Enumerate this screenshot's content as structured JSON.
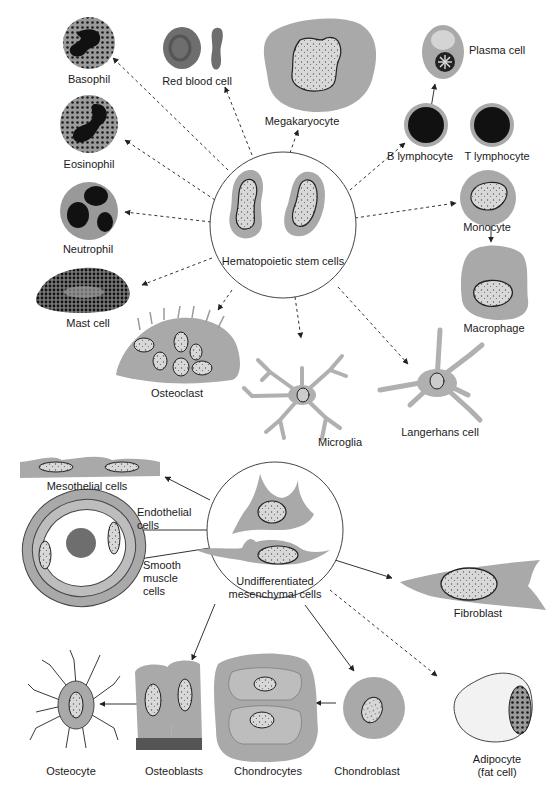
{
  "diagram": {
    "type": "cell lineage diagram",
    "colors": {
      "cytoplasm": "#a9a9a9",
      "cytoplasm_light": "#bdbdbd",
      "nucleus_dark": "#1c1c1c",
      "red_blood_cell": "#6e6e6e",
      "outline": "#333333",
      "arrow": "#333333",
      "background": "#ffffff"
    },
    "hematopoietic_group": {
      "source": {
        "label": "Hematopoietic stem cells",
        "x": 283,
        "y": 225,
        "r": 72
      },
      "arrow_style": "dashed",
      "targets": [
        {
          "label": "Basophil"
        },
        {
          "label": "Red blood cell"
        },
        {
          "label": "Megakaryocyte"
        },
        {
          "label": "Plasma cell"
        },
        {
          "label": "B lymphocyte"
        },
        {
          "label": "T lymphocyte"
        },
        {
          "label": "Eosinophil"
        },
        {
          "label": "Neutrophil"
        },
        {
          "label": "Monocyte"
        },
        {
          "label": "Macrophage"
        },
        {
          "label": "Mast cell"
        },
        {
          "label": "Osteoclast"
        },
        {
          "label": "Microglia"
        },
        {
          "label": "Langerhans cell"
        }
      ]
    },
    "mesenchymal_group": {
      "source": {
        "label": "Undifferentiated\nmesenchymal cells",
        "x": 275,
        "y": 530,
        "r": 68
      },
      "arrow_style": "solid",
      "targets": [
        {
          "label": "Mesothelial cells"
        },
        {
          "label": "Endothelial\ncells"
        },
        {
          "label": "Smooth\nmuscle\ncells"
        },
        {
          "label": "Fibroblast"
        },
        {
          "label": "Osteocyte"
        },
        {
          "label": "Osteoblasts"
        },
        {
          "label": "Chondrocytes"
        },
        {
          "label": "Chondroblast"
        },
        {
          "label": "Adipocyte\n(fat cell)"
        }
      ]
    },
    "relations": [
      {
        "from": "Hematopoietic stem cells",
        "to": "Basophil",
        "style": "dashed"
      },
      {
        "from": "Hematopoietic stem cells",
        "to": "Red blood cell",
        "style": "dashed"
      },
      {
        "from": "Hematopoietic stem cells",
        "to": "Megakaryocyte",
        "style": "dashed"
      },
      {
        "from": "Hematopoietic stem cells",
        "to": "B lymphocyte",
        "style": "dashed"
      },
      {
        "from": "B lymphocyte",
        "to": "Plasma cell",
        "style": "solid"
      },
      {
        "from": "Hematopoietic stem cells",
        "to": "Eosinophil",
        "style": "dashed"
      },
      {
        "from": "Hematopoietic stem cells",
        "to": "Neutrophil",
        "style": "dashed"
      },
      {
        "from": "Hematopoietic stem cells",
        "to": "Monocyte",
        "style": "dashed"
      },
      {
        "from": "Monocyte",
        "to": "Macrophage",
        "style": "solid"
      },
      {
        "from": "Hematopoietic stem cells",
        "to": "Mast cell",
        "style": "dashed"
      },
      {
        "from": "Hematopoietic stem cells",
        "to": "Osteoclast",
        "style": "dashed"
      },
      {
        "from": "Hematopoietic stem cells",
        "to": "Microglia",
        "style": "dashed"
      },
      {
        "from": "Hematopoietic stem cells",
        "to": "Langerhans cell",
        "style": "dashed"
      },
      {
        "from": "Undifferentiated mesenchymal cells",
        "to": "Mesothelial cells",
        "style": "solid"
      },
      {
        "from": "Undifferentiated mesenchymal cells",
        "to": "Endothelial cells",
        "style": "solid"
      },
      {
        "from": "Undifferentiated mesenchymal cells",
        "to": "Smooth muscle cells",
        "style": "solid"
      },
      {
        "from": "Undifferentiated mesenchymal cells",
        "to": "Fibroblast",
        "style": "solid"
      },
      {
        "from": "Undifferentiated mesenchymal cells",
        "to": "Osteoblasts",
        "style": "solid"
      },
      {
        "from": "Osteoblasts",
        "to": "Osteocyte",
        "style": "solid"
      },
      {
        "from": "Undifferentiated mesenchymal cells",
        "to": "Chondroblast",
        "style": "solid"
      },
      {
        "from": "Chondroblast",
        "to": "Chondrocytes",
        "style": "solid"
      },
      {
        "from": "Undifferentiated mesenchymal cells",
        "to": "Adipocyte (fat cell)",
        "style": "dashed"
      }
    ]
  },
  "labels": {
    "basophil": "Basophil",
    "red_blood_cell": "Red blood cell",
    "megakaryocyte": "Megakaryocyte",
    "plasma_cell": "Plasma cell",
    "b_lymphocyte": "B lymphocyte",
    "t_lymphocyte": "T lymphocyte",
    "eosinophil": "Eosinophil",
    "neutrophil": "Neutrophil",
    "monocyte": "Monocyte",
    "macrophage": "Macrophage",
    "mast_cell": "Mast cell",
    "osteoclast": "Osteoclast",
    "microglia": "Microglia",
    "langerhans_cell": "Langerhans cell",
    "hematopoietic_stem_cells": "Hematopoietic stem cells",
    "mesothelial_cells": "Mesothelial cells",
    "endothelial_cells": "Endothelial\ncells",
    "smooth_muscle_cells": "Smooth\nmuscle\ncells",
    "undifferentiated_mesenchymal_cells": "Undifferentiated\nmesenchymal cells",
    "fibroblast": "Fibroblast",
    "osteocyte": "Osteocyte",
    "osteoblasts": "Osteoblasts",
    "chondrocytes": "Chondrocytes",
    "chondroblast": "Chondroblast",
    "adipocyte": "Adipocyte\n(fat cell)"
  }
}
